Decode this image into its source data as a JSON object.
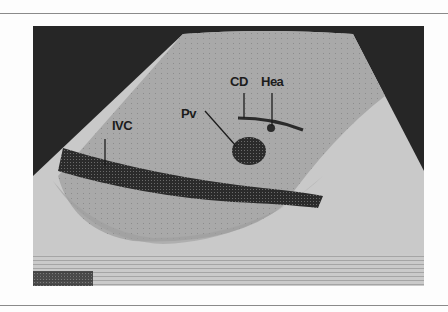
{
  "figure": {
    "type": "ultrasound-scan",
    "labels": {
      "ivc": "IVC",
      "pv": "Pv",
      "cd": "CD",
      "hea": "Hea"
    },
    "colors": {
      "background": "#262626",
      "liver": "#a8a8a8",
      "lower_tissue": "#c9c9c9",
      "vessel": "#2a2a2a",
      "page": "#fdfdfd"
    }
  }
}
